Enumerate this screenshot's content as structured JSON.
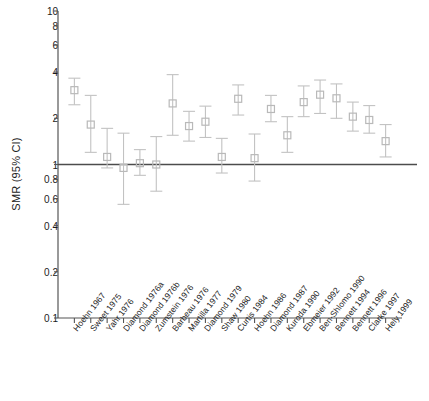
{
  "chart_data": {
    "type": "scatter",
    "title": "",
    "subtitle": "",
    "xlabel": "",
    "ylabel": "SMR (95% CI)",
    "yscale": "log",
    "ylim": [
      0.1,
      10
    ],
    "ytick_values": [
      0.1,
      0.2,
      0.4,
      0.6,
      0.8,
      1,
      2,
      4,
      6,
      8,
      10
    ],
    "ytick_labels": [
      "0.1",
      "0.2",
      "0.4",
      "0.6",
      "0.8",
      "1",
      "2",
      "4",
      "6",
      "8",
      "10"
    ],
    "grid": false,
    "legend": "none",
    "reference_line": {
      "y": 1,
      "label": "",
      "color": "#4c4c4c"
    },
    "marker": "open-square",
    "marker_color": "#b9b9b9",
    "error_bar_color": "#c2c2c2",
    "categories": [
      "Hoehn 1967",
      "Sweet 1975",
      "Yahr 1976",
      "Diamond 1976a",
      "Diamond 1976b",
      "Zumstein 1976",
      "Barbeau 1976",
      "Martilla 1977",
      "Diamond 1979",
      "Shaw 1980",
      "Curtis 1984",
      "Hoehn 1986",
      "Diamond 1987",
      "Kuroda 1990",
      "Ebmeier 1992",
      "Ben-Shlomo 1990",
      "Bennett 1994",
      "Bennett 1996",
      "Clarke 1997",
      "Hely 1999"
    ],
    "series": [
      {
        "name": "SMR",
        "values": [
          3.05,
          1.82,
          1.12,
          0.95,
          1.02,
          1.0,
          2.5,
          1.78,
          1.9,
          1.12,
          2.68,
          1.1,
          2.3,
          1.55,
          2.55,
          2.85,
          2.7,
          2.05,
          1.95,
          1.42
        ],
        "ci_lower": [
          2.45,
          1.2,
          0.95,
          0.55,
          0.85,
          0.67,
          1.55,
          1.42,
          1.5,
          0.88,
          2.1,
          0.78,
          1.9,
          1.2,
          2.05,
          2.15,
          2.0,
          1.65,
          1.6,
          1.12
        ],
        "ci_upper": [
          3.65,
          2.82,
          1.72,
          1.6,
          1.25,
          1.52,
          3.85,
          2.22,
          2.4,
          1.48,
          3.3,
          1.58,
          2.82,
          2.05,
          3.25,
          3.55,
          3.35,
          2.55,
          2.42,
          1.82
        ]
      }
    ]
  }
}
